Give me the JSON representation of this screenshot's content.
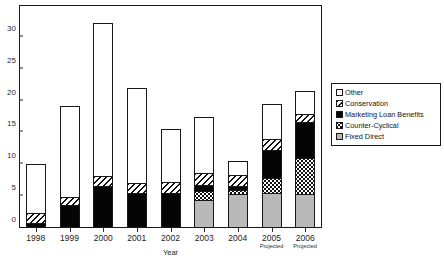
{
  "chart_data": {
    "type": "bar",
    "subtype": "stacked-vertical",
    "title": "",
    "xlabel": "Year",
    "ylabel": "",
    "ylim": [
      0,
      35
    ],
    "ytick_interval": 5,
    "yticks": [
      "0",
      "5",
      "10",
      "15",
      "20",
      "25",
      "30",
      "35"
    ],
    "grid": false,
    "legend_position": "right",
    "categories": [
      "1998",
      "1999",
      "2000",
      "2001",
      "2002",
      "2003",
      "2004",
      "2005",
      "2006"
    ],
    "category_sublabels": [
      "",
      "",
      "",
      "",
      "",
      "",
      "",
      "Projected",
      "Projected"
    ],
    "series": [
      {
        "name": "Fixed Direct",
        "pattern": "solid-gray",
        "color": "#b9b9b9",
        "values": [
          0.0,
          0.0,
          0.0,
          0.0,
          0.0,
          4.1,
          5.2,
          5.2,
          5.1
        ]
      },
      {
        "name": "Counter-Cyclical",
        "pattern": "dotted",
        "color": "#ffffff",
        "values": [
          0.0,
          0.0,
          0.0,
          0.0,
          0.0,
          1.5,
          0.6,
          2.5,
          5.7
        ]
      },
      {
        "name": "Marketing Loan Benefits",
        "pattern": "solid-black",
        "color": "#050505",
        "values": [
          0.5,
          3.3,
          6.4,
          5.3,
          5.3,
          1.0,
          0.6,
          4.5,
          5.7
        ]
      },
      {
        "name": "Conservation",
        "pattern": "diagonal-hatch",
        "color": "#ffffff",
        "values": [
          1.6,
          1.4,
          1.5,
          1.6,
          1.8,
          1.8,
          1.9,
          1.7,
          1.4
        ]
      },
      {
        "name": "Other",
        "pattern": "solid-white",
        "color": "#ffffff",
        "values": [
          8.0,
          14.5,
          24.3,
          15.1,
          8.5,
          9.0,
          2.2,
          5.6,
          3.6
        ]
      }
    ],
    "totals": [
      10.1,
      19.2,
      32.2,
      22.0,
      15.6,
      17.4,
      10.5,
      19.5,
      21.5
    ]
  },
  "legend": {
    "items": [
      {
        "label": "Other",
        "swatch": "white-swatch"
      },
      {
        "label": "Conservation",
        "swatch": "hatched-swatch"
      },
      {
        "label": "Marketing Loan Benefits",
        "swatch": "black-swatch"
      },
      {
        "label": "Counter-Cyclical",
        "swatch": "dotted-swatch"
      },
      {
        "label": "Fixed Direct",
        "swatch": "gray-swatch"
      }
    ]
  },
  "axis": {
    "x_title": "Year"
  }
}
